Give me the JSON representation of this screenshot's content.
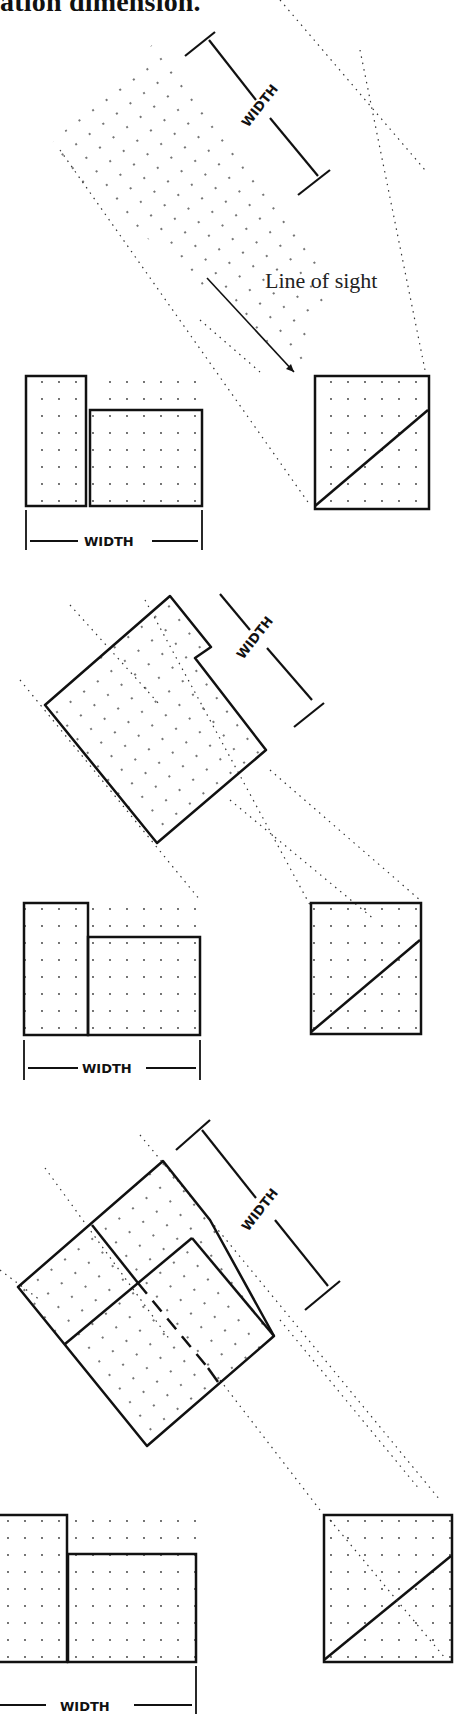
{
  "title": "ation dimension.",
  "line_of_sight_label": "Line of sight",
  "dimension_label": "WIDTH",
  "panels": [
    {
      "name": "panel-1",
      "auxiliary_view": "rotated-projection-dots",
      "front_view_label": "WIDTH",
      "aux_dimension_label": "WIDTH",
      "has_line_of_sight_arrow": true
    },
    {
      "name": "panel-2",
      "auxiliary_view": "notched-block",
      "front_view_label": "WIDTH",
      "aux_dimension_label": "WIDTH"
    },
    {
      "name": "panel-3",
      "auxiliary_view": "stepped-block-with-hidden-line",
      "front_view_label": "WIDTH",
      "aux_dimension_label": "WIDTH"
    }
  ],
  "colors": {
    "line": "#111111",
    "background": "#ffffff"
  }
}
